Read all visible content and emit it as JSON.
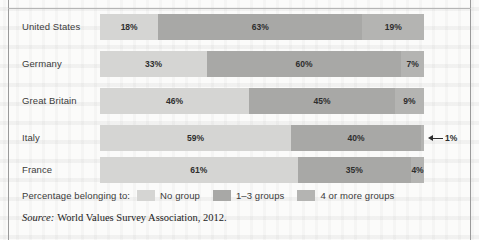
{
  "chart_data": {
    "type": "bar",
    "orientation": "horizontal",
    "stacked": true,
    "normalized_percent": true,
    "title": "",
    "xlabel": "",
    "ylabel": "",
    "xlim": [
      0,
      100
    ],
    "grid": false,
    "legend_position": "bottom",
    "legend_title": "Percentage belonging to:",
    "categories": [
      "United States",
      "Germany",
      "Great Britain",
      "Italy",
      "France"
    ],
    "series": [
      {
        "name": "No group",
        "color": "#d5d5d3",
        "values": [
          18,
          33,
          46,
          59,
          61
        ]
      },
      {
        "name": "1–3 groups",
        "color": "#a8a8a6",
        "values": [
          63,
          60,
          45,
          40,
          35
        ]
      },
      {
        "name": "4 or more groups",
        "color": "#b4b4b2",
        "values": [
          19,
          7,
          9,
          1,
          4
        ]
      }
    ],
    "rows": [
      {
        "label": "United States",
        "segments": [
          {
            "series": "No group",
            "value": 18,
            "value_label": "18%",
            "label_placement": "inside"
          },
          {
            "series": "1–3 groups",
            "value": 63,
            "value_label": "63%",
            "label_placement": "inside"
          },
          {
            "series": "4 or more groups",
            "value": 19,
            "value_label": "19%",
            "label_placement": "inside"
          }
        ]
      },
      {
        "label": "Germany",
        "segments": [
          {
            "series": "No group",
            "value": 33,
            "value_label": "33%",
            "label_placement": "inside"
          },
          {
            "series": "1–3 groups",
            "value": 60,
            "value_label": "60%",
            "label_placement": "inside"
          },
          {
            "series": "4 or more groups",
            "value": 7,
            "value_label": "7%",
            "label_placement": "inside"
          }
        ]
      },
      {
        "label": "Great Britain",
        "segments": [
          {
            "series": "No group",
            "value": 46,
            "value_label": "46%",
            "label_placement": "inside"
          },
          {
            "series": "1–3 groups",
            "value": 45,
            "value_label": "45%",
            "label_placement": "inside"
          },
          {
            "series": "4 or more groups",
            "value": 9,
            "value_label": "9%",
            "label_placement": "inside"
          }
        ]
      },
      {
        "label": "Italy",
        "segments": [
          {
            "series": "No group",
            "value": 59,
            "value_label": "59%",
            "label_placement": "inside"
          },
          {
            "series": "1–3 groups",
            "value": 40,
            "value_label": "40%",
            "label_placement": "inside"
          },
          {
            "series": "4 or more groups",
            "value": 1,
            "value_label": "1%",
            "label_placement": "callout"
          }
        ]
      },
      {
        "label": "France",
        "segments": [
          {
            "series": "No group",
            "value": 61,
            "value_label": "61%",
            "label_placement": "inside"
          },
          {
            "series": "1–3 groups",
            "value": 35,
            "value_label": "35%",
            "label_placement": "inside"
          },
          {
            "series": "4 or more groups",
            "value": 4,
            "value_label": "4%",
            "label_placement": "inside"
          }
        ]
      }
    ],
    "annotations": [
      {
        "row": "Italy",
        "text": "1%",
        "arrow": "left-pointing",
        "placement": "right-of-bar"
      }
    ]
  },
  "legend": {
    "title": "Percentage belonging to:",
    "items": [
      {
        "label": "No group",
        "color": "#d5d5d3"
      },
      {
        "label": "1–3 groups",
        "color": "#a8a8a6"
      },
      {
        "label": "4 or more groups",
        "color": "#b4b4b2"
      }
    ]
  },
  "source": {
    "prefix": "Source:",
    "text": "World Values Survey Association, 2012."
  }
}
